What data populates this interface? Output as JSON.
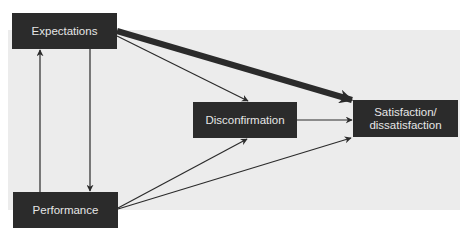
{
  "diagram": {
    "type": "flow",
    "colors": {
      "node_fill": "#2b2b2b",
      "node_text": "#e6e6e6",
      "panel": "#ececec",
      "edge": "#2b2b2b"
    },
    "nodes": {
      "expectations": {
        "label": "Expectations"
      },
      "performance": {
        "label": "Performance"
      },
      "disconfirmation": {
        "label": "Disconfirmation"
      },
      "satisfaction": {
        "label_line1": "Satisfaction/",
        "label_line2": "dissatisfaction"
      }
    },
    "edges": [
      {
        "from": "Expectations",
        "to": "Satisfaction/dissatisfaction",
        "weight": "thick"
      },
      {
        "from": "Expectations",
        "to": "Disconfirmation",
        "weight": "thin"
      },
      {
        "from": "Expectations",
        "to": "Performance",
        "weight": "thin"
      },
      {
        "from": "Performance",
        "to": "Expectations",
        "weight": "thin"
      },
      {
        "from": "Performance",
        "to": "Disconfirmation",
        "weight": "thin"
      },
      {
        "from": "Performance",
        "to": "Satisfaction/dissatisfaction",
        "weight": "thin"
      },
      {
        "from": "Disconfirmation",
        "to": "Satisfaction/dissatisfaction",
        "weight": "thin"
      }
    ]
  }
}
